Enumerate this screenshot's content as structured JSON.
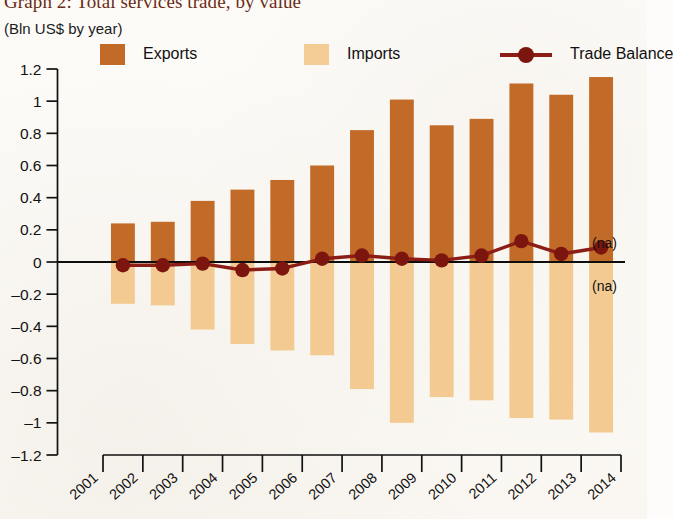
{
  "header": {
    "title": "Graph 2: Total services trade, by value",
    "subtitle": "(Bln US$ by year)"
  },
  "legend": {
    "position": "top",
    "items": [
      {
        "label": "Exports",
        "marker": "square-swatch",
        "color": "#c26a28"
      },
      {
        "label": "Imports",
        "marker": "square-swatch",
        "color": "#f3cd95"
      },
      {
        "label": "Trade Balance",
        "marker": "line-with-circle",
        "color": "#8b1d16"
      }
    ]
  },
  "annotations": [
    {
      "name": "na-above-zero",
      "text": "(na)"
    },
    {
      "name": "na-below-zero",
      "text": "(na)"
    }
  ],
  "chart_data": {
    "type": "bar",
    "title": "Graph 2: Total services trade, by value",
    "subtitle": "(Bln US$ by year)",
    "xlabel": "",
    "ylabel": "",
    "ylim": [
      -1.2,
      1.2
    ],
    "ytick_values": [
      1.2,
      1,
      0.8,
      0.6,
      0.4,
      0.2,
      0,
      -0.2,
      -0.4,
      -0.6,
      -0.8,
      -1,
      -1.2
    ],
    "ytick_labels": [
      "1.2",
      "1",
      "0.8",
      "0.6",
      "0.4",
      "0.2",
      "0",
      "-0.2",
      "-0.4",
      "-0.6",
      "-0.8",
      "-1",
      "-1.2"
    ],
    "categories": [
      "2001",
      "2002",
      "2003",
      "2004",
      "2005",
      "2006",
      "2007",
      "2008",
      "2009",
      "2010",
      "2011",
      "2012",
      "2013"
    ],
    "xtick_labels": [
      "2001",
      "2002",
      "2003",
      "2004",
      "2005",
      "2006",
      "2007",
      "2008",
      "2009",
      "2010",
      "2011",
      "2012",
      "2013",
      "2014"
    ],
    "grid": false,
    "series": [
      {
        "name": "Exports",
        "type": "bar",
        "color": "#c26a28",
        "values": [
          0.24,
          0.25,
          0.38,
          0.45,
          0.51,
          0.6,
          0.82,
          1.01,
          0.85,
          0.89,
          1.11,
          1.04,
          1.15
        ]
      },
      {
        "name": "Imports",
        "type": "bar",
        "color": "#f3cb92",
        "values": [
          -0.26,
          -0.27,
          -0.42,
          -0.51,
          -0.55,
          -0.58,
          -0.79,
          -1.0,
          -0.84,
          -0.86,
          -0.97,
          -0.98,
          -1.06
        ]
      },
      {
        "name": "Trade Balance",
        "type": "line",
        "color": "#8b1d16",
        "values": [
          -0.02,
          -0.02,
          -0.01,
          -0.05,
          -0.04,
          0.02,
          0.04,
          0.02,
          0.01,
          0.04,
          0.13,
          0.05,
          0.09
        ]
      }
    ]
  }
}
